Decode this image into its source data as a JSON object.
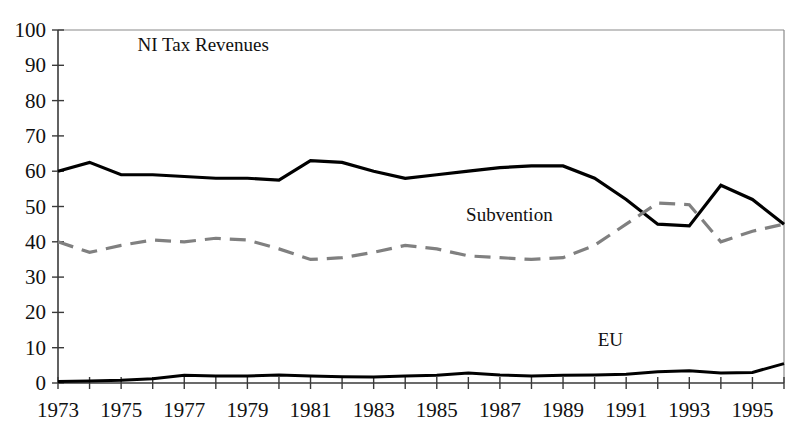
{
  "chart_data": {
    "type": "line",
    "title": "",
    "subtitle": "",
    "xlabel": "",
    "ylabel": "",
    "xlim": [
      1973,
      1996
    ],
    "ylim": [
      0,
      100
    ],
    "grid": false,
    "legend_position": "inline-annotations",
    "x": [
      1973,
      1974,
      1975,
      1976,
      1977,
      1978,
      1979,
      1980,
      1981,
      1982,
      1983,
      1984,
      1985,
      1986,
      1987,
      1988,
      1989,
      1990,
      1991,
      1992,
      1993,
      1994,
      1995,
      1996
    ],
    "x_tick_labels": [
      "1973",
      "1975",
      "1977",
      "1979",
      "1981",
      "1983",
      "1985",
      "1987",
      "1989",
      "1991",
      "1993",
      "1995"
    ],
    "x_tick_values": [
      1973,
      1975,
      1977,
      1979,
      1981,
      1983,
      1985,
      1987,
      1989,
      1991,
      1993,
      1995
    ],
    "y_tick_labels": [
      "0",
      "10",
      "20",
      "30",
      "40",
      "50",
      "60",
      "70",
      "80",
      "90",
      "100"
    ],
    "y_tick_values": [
      0,
      10,
      20,
      30,
      40,
      50,
      60,
      70,
      80,
      90,
      100
    ],
    "series": [
      {
        "name": "NI Tax Revenues",
        "style": "solid",
        "color": "#000000",
        "width": 3.2,
        "label_x": 1977.6,
        "label_y": 94,
        "values": [
          60,
          62.5,
          59,
          59,
          58.5,
          58,
          58,
          57.5,
          63,
          62.5,
          60,
          58,
          59,
          60,
          61,
          61.5,
          61.5,
          58,
          52,
          45,
          44.5,
          56,
          52,
          45
        ]
      },
      {
        "name": "Subvention",
        "style": "dashed",
        "color": "#808080",
        "width": 3.2,
        "label_x": 1987.3,
        "label_y": 46,
        "values": [
          40,
          37,
          39,
          40.5,
          40,
          41,
          40.5,
          38,
          35,
          35.5,
          37,
          39,
          38,
          36,
          35.5,
          35,
          35.5,
          39,
          45,
          51,
          50.5,
          40,
          43,
          45
        ]
      },
      {
        "name": "EU",
        "style": "solid",
        "color": "#000000",
        "width": 3.0,
        "label_x": 1990.5,
        "label_y": 10.5,
        "values": [
          0.4,
          0.6,
          0.8,
          1.2,
          2.2,
          2.0,
          2.0,
          2.3,
          2.0,
          1.8,
          1.7,
          2.0,
          2.2,
          2.8,
          2.3,
          2.0,
          2.2,
          2.3,
          2.5,
          3.2,
          3.5,
          2.8,
          3.0,
          5.5
        ]
      }
    ]
  },
  "plot": {
    "left": 58,
    "right": 784,
    "top": 30,
    "bottom": 383
  }
}
